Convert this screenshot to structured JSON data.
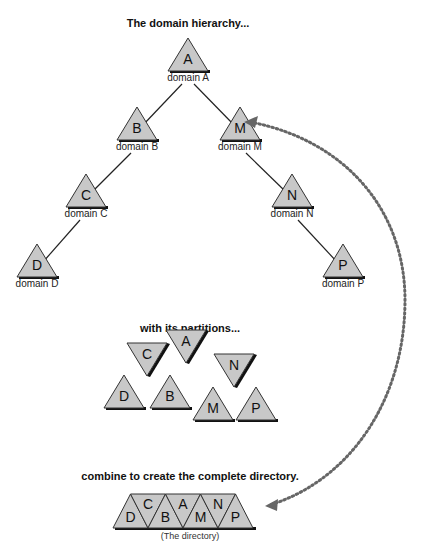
{
  "titles": {
    "hierarchy": "The domain hierarchy...",
    "partitions": "with its partitions...",
    "combine": "combine to create the complete directory."
  },
  "colors": {
    "triangle_fill": "#c8c8c8",
    "triangle_stroke": "#333333",
    "shadow": "#111111",
    "arrow": "#666666"
  },
  "hierarchy": {
    "nodes": [
      {
        "id": "A",
        "letter": "A",
        "label": "domain A",
        "x": 188,
        "y": 38
      },
      {
        "id": "B",
        "letter": "B",
        "label": "domain B",
        "x": 137,
        "y": 107
      },
      {
        "id": "M",
        "letter": "M",
        "label": "domain M",
        "x": 240,
        "y": 107
      },
      {
        "id": "C",
        "letter": "C",
        "label": "domain C",
        "x": 86,
        "y": 174
      },
      {
        "id": "N",
        "letter": "N",
        "label": "domain N",
        "x": 292,
        "y": 174
      },
      {
        "id": "D",
        "letter": "D",
        "label": "domain D",
        "x": 37,
        "y": 244
      },
      {
        "id": "P",
        "letter": "P",
        "label": "domain P",
        "x": 343,
        "y": 244
      }
    ],
    "edges": [
      [
        "A",
        "B"
      ],
      [
        "A",
        "M"
      ],
      [
        "B",
        "C"
      ],
      [
        "C",
        "D"
      ],
      [
        "M",
        "N"
      ],
      [
        "N",
        "P"
      ]
    ]
  },
  "partitions": {
    "pieces": [
      {
        "letter": "D",
        "dir": "up",
        "x": 124,
        "y": 375
      },
      {
        "letter": "C",
        "dir": "down",
        "x": 147,
        "y": 343
      },
      {
        "letter": "B",
        "dir": "up",
        "x": 170,
        "y": 375
      },
      {
        "letter": "A",
        "dir": "down",
        "x": 186,
        "y": 330
      },
      {
        "letter": "M",
        "dir": "up",
        "x": 213,
        "y": 387
      },
      {
        "letter": "N",
        "dir": "down",
        "x": 234,
        "y": 354
      },
      {
        "letter": "P",
        "dir": "up",
        "x": 256,
        "y": 387
      }
    ]
  },
  "directory": {
    "caption": "(The directory)",
    "sequence": [
      "D",
      "C",
      "B",
      "A",
      "M",
      "N",
      "P"
    ]
  }
}
